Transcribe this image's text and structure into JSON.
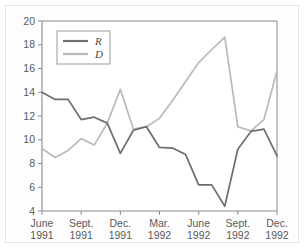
{
  "chart_data": {
    "type": "line",
    "title": "",
    "xlabel": "",
    "ylabel": "",
    "ylim": [
      4,
      20
    ],
    "ytick_values": [
      4,
      6,
      8,
      10,
      12,
      14,
      16,
      18,
      20
    ],
    "ytick_labels": [
      "4",
      "6",
      "8",
      "10",
      "12",
      "14",
      "16",
      "18",
      "20"
    ],
    "grid": false,
    "legend_position": "upper-left-inside",
    "x": [
      "June 1991",
      "July 1991",
      "Aug. 1991",
      "Sept. 1991",
      "Oct. 1991",
      "Nov. 1991",
      "Dec. 1991",
      "Jan. 1992",
      "Feb. 1992",
      "Mar. 1992",
      "Apr. 1992",
      "May 1992",
      "June 1992",
      "July 1992",
      "Aug. 1992",
      "Sept. 1992",
      "Oct. 1992",
      "Nov. 1992",
      "Dec. 1992"
    ],
    "xtick_labels": [
      {
        "line1": "June",
        "line2": "1991"
      },
      {
        "line1": "Sept.",
        "line2": "1991"
      },
      {
        "line1": "Dec.",
        "line2": "1991"
      },
      {
        "line1": "Mar.",
        "line2": "1992"
      },
      {
        "line1": "June",
        "line2": "1992"
      },
      {
        "line1": "Sept.",
        "line2": "1992"
      },
      {
        "line1": "Dec.",
        "line2": "1992"
      }
    ],
    "xtick_indices": [
      0,
      3,
      6,
      9,
      12,
      15,
      18
    ],
    "series": [
      {
        "name": "R",
        "color": "#6e6e6e",
        "values": [
          14.0,
          13.4,
          13.4,
          11.7,
          11.9,
          11.4,
          8.85,
          10.8,
          11.1,
          9.35,
          9.3,
          8.75,
          6.2,
          6.2,
          4.4,
          9.2,
          10.7,
          10.9,
          8.65
        ]
      },
      {
        "name": "D",
        "color": "#b9b9b9",
        "values": [
          9.25,
          8.5,
          9.1,
          10.1,
          9.55,
          11.4,
          14.25,
          10.9,
          11.1,
          11.8,
          13.3,
          14.9,
          16.5,
          17.6,
          18.65,
          11.1,
          10.75,
          11.7,
          15.8
        ]
      }
    ],
    "legend": [
      {
        "label": "R",
        "color": "#6e6e6e"
      },
      {
        "label": "D",
        "color": "#b9b9b9"
      }
    ]
  },
  "style": {
    "background": "#ffffff",
    "panel_background": "#fdfdfd",
    "axis_color": "#8c8c8c",
    "tick_label_color": "#5a5a5a",
    "legend_border_color": "#9a9a9a",
    "series_r_color": "#6e6e6e",
    "series_d_color": "#b9b9b9"
  }
}
